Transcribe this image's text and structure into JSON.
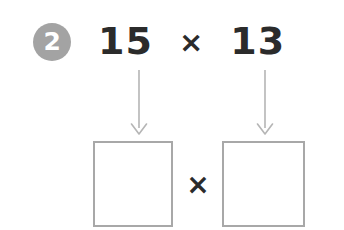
{
  "page": {
    "background_color": "#ffffff",
    "width": 344,
    "height": 230
  },
  "step": {
    "number": "2",
    "badge_color": "#a3a3a3",
    "badge_text_color": "#ffffff"
  },
  "expression": {
    "left_factor": "15",
    "operator": "×",
    "right_factor": "13",
    "text_color": "#2b2b2b"
  },
  "arrows": [
    {
      "name": "arrow-left-factor",
      "direction": "down",
      "color": "#b5b5b5",
      "points_from": "15",
      "points_to": "left-answer-box"
    },
    {
      "name": "arrow-right-factor",
      "direction": "down",
      "color": "#b5b5b5",
      "points_from": "13",
      "points_to": "right-answer-box"
    }
  ],
  "answer_row": {
    "left_box": {
      "value": "",
      "border_color": "#a8a8a8",
      "fill_color": "#ffffff"
    },
    "operator": "×",
    "right_box": {
      "value": "",
      "border_color": "#a8a8a8",
      "fill_color": "#ffffff"
    }
  }
}
